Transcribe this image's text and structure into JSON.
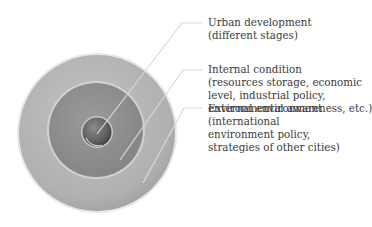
{
  "diagram": {
    "type": "concentric-circles",
    "layers": [
      {
        "id": "core",
        "title": "Urban development",
        "detail": [
          "(different stages)"
        ]
      },
      {
        "id": "middle",
        "title": "Internal condition",
        "detail": [
          "(resources storage, economic",
          "level, industrial policy,",
          "environmental awareness, etc.)"
        ]
      },
      {
        "id": "outer",
        "title": "External environment",
        "detail": [
          "(international",
          "environment policy,",
          "strategies of other cities)"
        ]
      }
    ],
    "colors": {
      "outer_ring": "#b5b5b5",
      "middle_ring": "#8f8f8f",
      "core": "#6a6a6a",
      "leader_line": "#d9d9d9",
      "text": "#3a3a3a"
    }
  }
}
